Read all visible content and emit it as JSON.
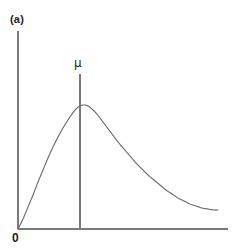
{
  "figure": {
    "panel_label": "(a)",
    "origin_label": "0",
    "mean_label": "μ",
    "background_color": "#ffffff",
    "axis_color": "#7a7a7a",
    "curve_color": "#6e6e6e",
    "marker_color": "#7a7a7a",
    "text_color": "#1c1c1c"
  },
  "chart_data": {
    "type": "line",
    "title": "(a)",
    "xlabel": "",
    "ylabel": "",
    "grid": false,
    "legend": null,
    "axis_ranges": {
      "x_pixels": [
        18,
        228
      ],
      "y_pixels": [
        31,
        229
      ]
    },
    "annotations": [
      {
        "name": "panel-label",
        "text": "(a)",
        "x": 10,
        "y": 15
      },
      {
        "name": "origin-label",
        "text": "0",
        "x": 13,
        "y": 232
      },
      {
        "name": "mean-label",
        "text": "μ",
        "x": 80,
        "y": 64
      }
    ],
    "mean_marker": {
      "label": "μ",
      "x": 80,
      "y_top": 74,
      "y_bottom": 229
    },
    "series": [
      {
        "name": "right-skewed-density",
        "description": "Unimodal positively skewed probability density curve",
        "peak": {
          "x": 80,
          "y": 106
        },
        "points": [
          [
            18,
            229
          ],
          [
            23,
            219
          ],
          [
            28,
            207
          ],
          [
            33,
            195
          ],
          [
            38,
            182
          ],
          [
            43,
            170
          ],
          [
            48,
            158
          ],
          [
            53,
            147
          ],
          [
            58,
            137
          ],
          [
            63,
            128
          ],
          [
            68,
            120
          ],
          [
            72,
            114
          ],
          [
            76,
            109
          ],
          [
            80,
            106
          ],
          [
            84,
            105
          ],
          [
            88,
            106
          ],
          [
            92,
            109
          ],
          [
            96,
            113
          ],
          [
            100,
            118
          ],
          [
            106,
            126
          ],
          [
            112,
            134
          ],
          [
            118,
            142
          ],
          [
            124,
            149
          ],
          [
            130,
            156
          ],
          [
            136,
            163
          ],
          [
            142,
            169
          ],
          [
            148,
            175
          ],
          [
            154,
            180
          ],
          [
            160,
            185
          ],
          [
            166,
            190
          ],
          [
            172,
            194
          ],
          [
            178,
            198
          ],
          [
            184,
            201
          ],
          [
            190,
            204
          ],
          [
            196,
            206
          ],
          [
            202,
            208
          ],
          [
            208,
            209
          ],
          [
            214,
            210
          ],
          [
            218,
            210
          ]
        ]
      }
    ],
    "axes": {
      "y_axis": {
        "x": 18,
        "y_top": 31,
        "y_bottom": 229
      },
      "x_axis": {
        "y": 229,
        "x_left": 18,
        "x_right": 228
      }
    }
  }
}
